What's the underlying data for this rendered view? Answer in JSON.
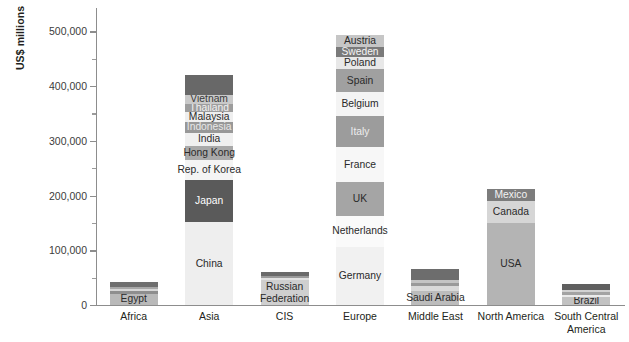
{
  "chart_data": {
    "type": "bar",
    "subtype": "stacked-bar",
    "title": "",
    "xlabel": "",
    "ylabel": "US$ millions",
    "ylim": [
      0,
      530000
    ],
    "y_major_ticks": [
      0,
      100000,
      200000,
      300000,
      400000,
      500000
    ],
    "y_major_tick_labels": [
      "0",
      "100,000",
      "200,000",
      "300,000",
      "400,000",
      "500,000"
    ],
    "y_minor_ticks": [
      50000,
      150000,
      250000,
      350000,
      450000
    ],
    "grid": false,
    "legend": "none",
    "categories": [
      "Africa",
      "Asia",
      "CIS",
      "Europe",
      "Middle East",
      "North America",
      "South Central America"
    ],
    "bars": [
      {
        "category": "Africa",
        "total": 42000,
        "segments": [
          {
            "label": "Egypt",
            "value": 21000,
            "color": "#b9b9b9",
            "text_color": "#2a2a2a"
          },
          {
            "label": "",
            "value": 5000,
            "color": "#8e8e8e",
            "text_color": "#2a2a2a"
          },
          {
            "label": "",
            "value": 4000,
            "color": "#d8d8d8",
            "text_color": "#2a2a2a"
          },
          {
            "label": "",
            "value": 3500,
            "color": "#a8a8a8",
            "text_color": "#2a2a2a"
          },
          {
            "label": "",
            "value": 8500,
            "color": "#6f6f6f",
            "text_color": "#ffffff"
          }
        ]
      },
      {
        "category": "Asia",
        "total": 421000,
        "segments": [
          {
            "label": "China",
            "value": 151000,
            "color": "#eeeeee",
            "text_color": "#2a2a2a"
          },
          {
            "label": "Japan",
            "value": 77000,
            "color": "#5a5a5a",
            "text_color": "#ffffff"
          },
          {
            "label": "Rep. of Korea",
            "value": 37000,
            "color": "#f4f4f4",
            "text_color": "#2a2a2a"
          },
          {
            "label": "Hong Kong",
            "value": 25000,
            "color": "#a9a9a9",
            "text_color": "#2a2a2a"
          },
          {
            "label": "India",
            "value": 25000,
            "color": "#f0f0f0",
            "text_color": "#2a2a2a"
          },
          {
            "label": "Indonesia",
            "value": 19000,
            "color": "#989898",
            "text_color": "#e8e8e8"
          },
          {
            "label": "Malaysia",
            "value": 18000,
            "color": "#efefef",
            "text_color": "#2a2a2a"
          },
          {
            "label": "Thailand",
            "value": 15000,
            "color": "#9d9d9d",
            "text_color": "#f2f2f2"
          },
          {
            "label": "Vietnam",
            "value": 17000,
            "color": "#c9c9c9",
            "text_color": "#3a3a3a"
          },
          {
            "label": "",
            "value": 37000,
            "color": "#686868",
            "text_color": "#ffffff"
          }
        ]
      },
      {
        "category": "CIS",
        "total": 60000,
        "segments": [
          {
            "label": "Russian Federation",
            "value": 45000,
            "color": "#cfcfcf",
            "text_color": "#2a2a2a"
          },
          {
            "label": "",
            "value": 4000,
            "color": "#e2e2e2",
            "text_color": "#2a2a2a"
          },
          {
            "label": "",
            "value": 4000,
            "color": "#9a9a9a",
            "text_color": "#2a2a2a"
          },
          {
            "label": "",
            "value": 7000,
            "color": "#6a6a6a",
            "text_color": "#ffffff"
          }
        ]
      },
      {
        "category": "Europe",
        "total": 527000,
        "segments": [
          {
            "label": "Germany",
            "value": 106000,
            "color": "#f1f1f1",
            "text_color": "#2a2a2a"
          },
          {
            "label": "Netherlands",
            "value": 57000,
            "color": "#fafafa",
            "text_color": "#2a2a2a"
          },
          {
            "label": "UK",
            "value": 62000,
            "color": "#a5a5a5",
            "text_color": "#2a2a2a"
          },
          {
            "label": "France",
            "value": 63000,
            "color": "#f7f7f7",
            "text_color": "#2a2a2a"
          },
          {
            "label": "Italy",
            "value": 57000,
            "color": "#9c9c9c",
            "text_color": "#ededed"
          },
          {
            "label": "Belgium",
            "value": 44000,
            "color": "#f4f4f4",
            "text_color": "#2a2a2a"
          },
          {
            "label": "Spain",
            "value": 42000,
            "color": "#a0a0a0",
            "text_color": "#2a2a2a"
          },
          {
            "label": "Poland",
            "value": 22000,
            "color": "#e8e8e8",
            "text_color": "#2a2a2a"
          },
          {
            "label": "Sweden",
            "value": 19000,
            "color": "#7a7a7a",
            "text_color": "#f4f4f4"
          },
          {
            "label": "Austria",
            "value": 22000,
            "color": "#c6c6c6",
            "text_color": "#2a2a2a"
          }
        ]
      },
      {
        "category": "Middle East",
        "total": 66000,
        "segments": [
          {
            "label": "Saudi Arabia",
            "value": 26000,
            "color": "#bcbcbc",
            "text_color": "#2a2a2a"
          },
          {
            "label": "",
            "value": 8000,
            "color": "#d9d9d9",
            "text_color": "#2a2a2a"
          },
          {
            "label": "",
            "value": 6000,
            "color": "#9a9a9a",
            "text_color": "#2a2a2a"
          },
          {
            "label": "",
            "value": 6000,
            "color": "#c4c4c4",
            "text_color": "#2a2a2a"
          },
          {
            "label": "",
            "value": 20000,
            "color": "#6d6d6d",
            "text_color": "#ffffff"
          }
        ]
      },
      {
        "category": "North America",
        "total": 212000,
        "segments": [
          {
            "label": "USA",
            "value": 150000,
            "color": "#b4b4b4",
            "text_color": "#2a2a2a"
          },
          {
            "label": "Canada",
            "value": 40000,
            "color": "#d6d6d6",
            "text_color": "#2a2a2a"
          },
          {
            "label": "Mexico",
            "value": 22000,
            "color": "#7c7c7c",
            "text_color": "#f2f2f2"
          }
        ]
      },
      {
        "category": "South Central America",
        "total": 38000,
        "segments": [
          {
            "label": "Brazil",
            "value": 14000,
            "color": "#c2c2c2",
            "text_color": "#2a2a2a"
          },
          {
            "label": "",
            "value": 5000,
            "color": "#ebebeb",
            "text_color": "#2a2a2a"
          },
          {
            "label": "",
            "value": 4000,
            "color": "#a3a3a3",
            "text_color": "#2a2a2a"
          },
          {
            "label": "",
            "value": 4000,
            "color": "#d2d2d2",
            "text_color": "#2a2a2a"
          },
          {
            "label": "",
            "value": 11000,
            "color": "#5f5f5f",
            "text_color": "#ffffff"
          }
        ]
      }
    ]
  }
}
